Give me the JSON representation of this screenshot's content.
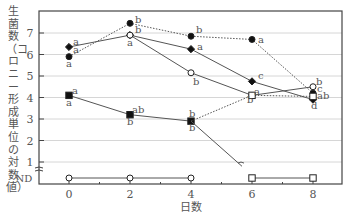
{
  "chart_data": {
    "type": "line",
    "title": "",
    "xlabel": "日数",
    "ylabel": "生菌数（コロニー形成単位の対数値）",
    "x": [
      0,
      2,
      4,
      6,
      8
    ],
    "x_ticks": [
      "0",
      "2",
      "4",
      "6",
      "8"
    ],
    "y_ticks": [
      "1",
      "2",
      "3",
      "4",
      "5",
      "6",
      "7"
    ],
    "y_bottom_label": "ND",
    "ylim": [
      0.3,
      7.9
    ],
    "grid": true,
    "legend": null,
    "series": [
      {
        "name": "filled-circle-dotted",
        "marker": "filled-circle",
        "line": "dotted",
        "x": [
          0,
          2,
          4,
          6,
          8
        ],
        "values": [
          5.9,
          7.45,
          6.85,
          6.7,
          4.2
        ],
        "labels": [
          "a",
          "b",
          "b",
          "a",
          "ab"
        ]
      },
      {
        "name": "filled-diamond-solid-then-dotted",
        "marker": "filled-diamond",
        "line": "solid",
        "x": [
          0,
          2,
          4,
          6,
          8
        ],
        "values": [
          6.35,
          6.9,
          6.25,
          4.75,
          3.9
        ],
        "labels": [
          "a",
          "b",
          "a",
          "c",
          "d"
        ]
      },
      {
        "name": "open-circle-solid",
        "marker": "open-circle",
        "line": "solid",
        "x": [
          2,
          4,
          6,
          8
        ],
        "values": [
          6.9,
          5.15,
          4.1,
          4.5
        ],
        "labels": [
          "",
          "b",
          "a",
          "b"
        ]
      },
      {
        "name": "filled-square-solid",
        "marker": "filled-square",
        "line": "solid",
        "x": [
          0,
          2,
          4
        ],
        "values": [
          4.1,
          3.2,
          2.9
        ],
        "labels": [
          "a",
          "ab",
          "b"
        ]
      },
      {
        "name": "square-dotted-branch",
        "marker": "open-square",
        "line": "dotted",
        "x": [
          4,
          6,
          8
        ],
        "values": [
          2.9,
          4.1,
          4.05
        ],
        "labels": [
          "b",
          "b",
          "c"
        ]
      },
      {
        "name": "square-to-ND",
        "marker": "open-square",
        "line": "solid",
        "x": [
          4,
          6,
          8
        ],
        "values": [
          "2.9",
          "ND",
          "ND"
        ],
        "labels": [
          "b",
          "",
          ""
        ]
      },
      {
        "name": "open-circle-ND",
        "marker": "open-circle",
        "line": "solid",
        "x": [
          0,
          2,
          4
        ],
        "values": [
          "ND",
          "ND",
          "ND"
        ],
        "labels": [
          "",
          "",
          ""
        ]
      }
    ],
    "annotations_top_labels": {
      "day0": [
        "a (diamond)",
        "a (circle, below)"
      ],
      "day0_square": [
        "a (above)",
        "a (below)"
      ],
      "day2": [
        "b",
        "b"
      ],
      "day2_square": [
        "ab (above)",
        "b (below)"
      ],
      "day4_square": [
        "b (above)",
        "b (below)"
      ],
      "day8": [
        "b",
        "c",
        "ab",
        "d"
      ]
    }
  }
}
